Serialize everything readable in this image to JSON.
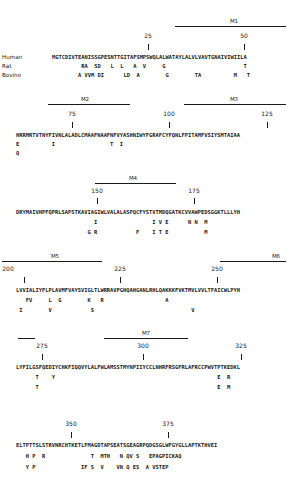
{
  "figure": {
    "species_labels": [
      "Human",
      "Rat",
      "Bovine"
    ],
    "blocks": [
      {
        "numbers": [
          {
            "label": "25",
            "x": 148
          },
          {
            "label": "50",
            "x": 244
          }
        ],
        "ticks": [
          148,
          244
        ],
        "tm_segments": [
          {
            "label": "M1",
            "x1": 175,
            "x2": 286
          }
        ],
        "human": "MGTCDIVTEANISSGPESNTTGITAFSMPSWQLALWATAYLALVLVAVTGNAIVIWIILA",
        "rat": "         RA  SD   L  L   A  V     G                        T       ",
        "bovine": "        A VVM DI      LD  A        G        TA          M   T       "
      },
      {
        "numbers": [
          {
            "label": "75",
            "x": 72
          },
          {
            "label": "100",
            "x": 169
          },
          {
            "label": "125",
            "x": 267
          }
        ],
        "ticks": [
          72,
          169,
          267
        ],
        "tm_segments": [
          {
            "label": "M2",
            "x1": 48,
            "x2": 130
          },
          {
            "label": "M3",
            "x1": 184,
            "x2": 286
          }
        ],
        "line1": "HRRMRTVTNYFIVNLALADLCMAAFNAAFNFVYASHNIWYFGRAFCYFQNLFPITAMFVSIYSMTAIAA",
        "line2": "E          I                 T  I",
        "line3": "Q"
      },
      {
        "numbers": [
          {
            "label": "150",
            "x": 97
          },
          {
            "label": "175",
            "x": 194
          }
        ],
        "ticks": [
          97,
          194
        ],
        "tm_segments": [
          {
            "label": "M4",
            "x1": 95,
            "x2": 176
          }
        ],
        "line1": "DRYMAIVHPFQPRLSAPSTKAVIAGIWLVALALASPQCFYSTVTMDQGATKCVVAWPEDSGGKTLLLYH",
        "line2": "                        I                 I V E      N N  M",
        "line3": "                      G R            F    I T E           M"
      },
      {
        "numbers": [
          {
            "label": "200",
            "x": 8
          },
          {
            "label": "225",
            "x": 120
          },
          {
            "label": "250",
            "x": 217
          }
        ],
        "ticks": [
          24,
          120,
          217
        ],
        "tm_segments": [
          {
            "label": "M5",
            "x1": 2,
            "x2": 102
          },
          {
            "label": "M6",
            "x1": 220,
            "x2": 286
          }
        ],
        "line1": "LVVIALIYFLPLAVMFVAYSVIGLTLWRRAVPGHQAHGANLRHLQAKKKFVKTMVLVVLTFAICWLPYH",
        "line2": "   FV     L  G        K   R                   A",
        "line3": " I        V            S                              V"
      },
      {
        "numbers": [
          {
            "label": "275",
            "x": 42
          },
          {
            "label": "300",
            "x": 143
          },
          {
            "label": "325",
            "x": 241
          }
        ],
        "ticks": [
          42,
          143,
          241
        ],
        "tm_segments": [
          {
            "label": "M7",
            "x1": 104,
            "x2": 188
          },
          {
            "label": "",
            "x1": 18,
            "x2": 35
          }
        ],
        "line1": "LYFILGSFQEDIYCHKFIQQVYLALFWLAMSSTMYNPIIYCCLNHRFRSGFRLAFRCCPWVTPTKEDKL",
        "line2": "      T    Y                                                  E  R",
        "line3": "      T                                                       E  M"
      },
      {
        "numbers": [
          {
            "label": "350",
            "x": 71
          },
          {
            "label": "375",
            "x": 168
          }
        ],
        "ticks": [
          71,
          168
        ],
        "tm_segments": [],
        "line1": "ELTPTTSLSTRVNRCHTKETLFMAGDTAPSEATSGEAGRPQDGSGLWFGYGLLAPTKTHVEI",
        "line2": "   H P  R              T  MTH   N QV S   EPAGPICKAQ",
        "line3": "   Y P              IF S  V    VN Q ES  A VSTEP"
      }
    ]
  }
}
